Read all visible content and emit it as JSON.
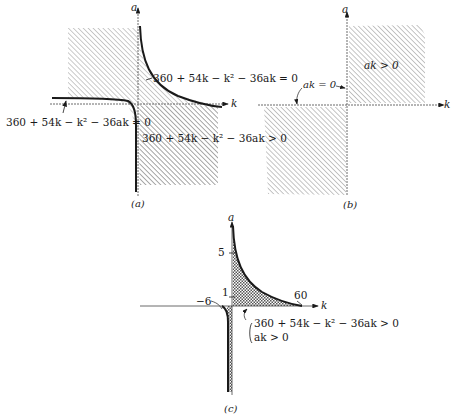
{
  "figure": {
    "panels": [
      {
        "id": "a",
        "caption": "(a)",
        "axis_x": "k",
        "axis_y": "a",
        "labels": {
          "upper_curve": "360 + 54k − k² − 36ak = 0",
          "lower_curve": "360 + 54k − k² − 36ak = 0",
          "region": "360 + 54k − k² − 36ak > 0"
        }
      },
      {
        "id": "b",
        "caption": "(b)",
        "axis_x": "k",
        "axis_y": "a",
        "labels": {
          "region": "ak > 0",
          "boundary": "ak = 0"
        }
      },
      {
        "id": "c",
        "caption": "(c)",
        "axis_x": "k",
        "axis_y": "a",
        "ticks": {
          "y5": "5",
          "y1": "1",
          "k_neg": "−6",
          "k_pos": "60"
        },
        "labels": {
          "cond1": "360 + 54k − k² − 36ak > 0",
          "cond2": "ak > 0"
        }
      }
    ]
  },
  "colors": {
    "ink": "#1a1a1a",
    "hatch": "#9a9a9a"
  }
}
